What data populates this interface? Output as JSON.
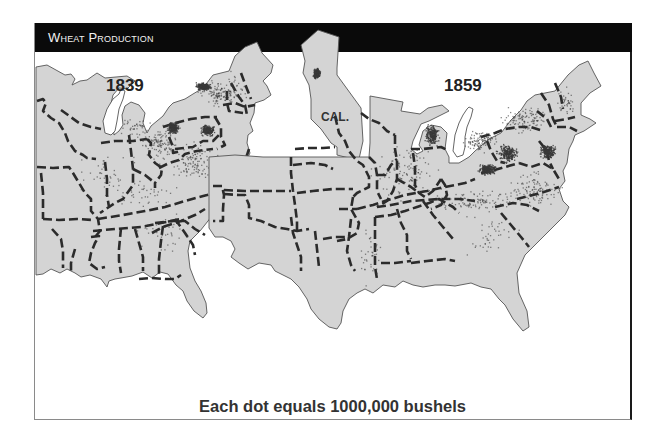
{
  "header": {
    "title": "Wheat Production"
  },
  "maps": [
    {
      "id": "1839",
      "year_label": "1839",
      "dot_clusters": [
        {
          "region": "western-new-york",
          "density": "high"
        },
        {
          "region": "central-new-york",
          "density": "medium"
        },
        {
          "region": "southeastern-pennsylvania",
          "density": "high"
        },
        {
          "region": "western-pennsylvania-ohio",
          "density": "high"
        },
        {
          "region": "ohio",
          "density": "medium"
        },
        {
          "region": "virginia-maryland",
          "density": "medium"
        },
        {
          "region": "kentucky-tennessee",
          "density": "low"
        },
        {
          "region": "indiana-illinois",
          "density": "low"
        },
        {
          "region": "michigan-south",
          "density": "low"
        },
        {
          "region": "new-england",
          "density": "low"
        },
        {
          "region": "carolinas-georgia",
          "density": "low"
        }
      ]
    },
    {
      "id": "1859",
      "year_label": "1859",
      "inset_label": "CAL.",
      "dot_clusters": [
        {
          "region": "california-central-valley",
          "density": "high"
        },
        {
          "region": "wisconsin-northern-illinois",
          "density": "high"
        },
        {
          "region": "indiana-ohio-west",
          "density": "high"
        },
        {
          "region": "southeastern-pennsylvania",
          "density": "high"
        },
        {
          "region": "ohio",
          "density": "high"
        },
        {
          "region": "virginia",
          "density": "medium"
        },
        {
          "region": "kentucky-tennessee",
          "density": "medium"
        },
        {
          "region": "iowa-missouri",
          "density": "medium"
        },
        {
          "region": "michigan-south",
          "density": "medium"
        },
        {
          "region": "new-york",
          "density": "medium"
        },
        {
          "region": "georgia-alabama",
          "density": "low"
        },
        {
          "region": "texas",
          "density": "low"
        },
        {
          "region": "new-england",
          "density": "low"
        }
      ]
    }
  ],
  "legend": {
    "caption": "Each dot equals 1000,000 bushels"
  },
  "colors": {
    "land": "#d4d4d4",
    "dot": "#3a3a3a",
    "border": "#2b2b2b",
    "header": "#0a0a0a"
  }
}
